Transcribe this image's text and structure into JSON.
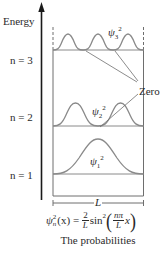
{
  "figure": {
    "axis_label": "Energy",
    "levels": [
      {
        "n": 3,
        "label": "n = 3",
        "psi_sub": "3",
        "psi_sup": "2"
      },
      {
        "n": 2,
        "label": "n = 2",
        "psi_sub": "2",
        "psi_sup": "2"
      },
      {
        "n": 1,
        "label": "n = 1",
        "psi_sub": "1",
        "psi_sup": "2"
      }
    ],
    "psi_symbol": "ψ",
    "zero_label": "Zero",
    "width_label": "L",
    "equation": {
      "lhs_psi": "ψ",
      "lhs_sub": "n",
      "lhs_sup": "2",
      "lhs_arg": "(x) =",
      "frac1_num": "2",
      "frac1_den": "L",
      "func": "sin",
      "func_sup": "2",
      "open_paren": "(",
      "frac2_num": "nπ",
      "frac2_den": "L",
      "var": "x",
      "close_paren": ")"
    },
    "caption": "The probabilities",
    "colors": {
      "curve": "#8a8a8a",
      "box": "#6e6e6e",
      "axis": "#1a1a1a",
      "text": "#2a2a2a"
    }
  }
}
